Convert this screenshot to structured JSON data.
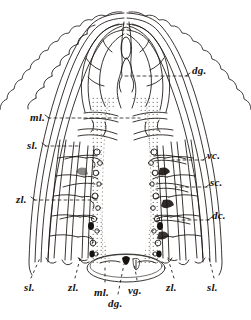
{
  "plate": {
    "kind": "scientific-illustration",
    "subject": "anterior dissection, dorsal view",
    "style": "line engraving, stippled median band",
    "background_color": "#ffffff",
    "ink_color": "#16120f",
    "width": 251,
    "height": 320
  },
  "labels": {
    "right": [
      {
        "id": "dg-right",
        "text": "dg.",
        "x": 192,
        "y": 70,
        "leader": "dashed"
      },
      {
        "id": "vc-right",
        "text": "vc.",
        "x": 207,
        "y": 155,
        "leader": "dashed"
      },
      {
        "id": "sc-right",
        "text": "sc.",
        "x": 210,
        "y": 182,
        "leader": "dashed"
      },
      {
        "id": "dc-right",
        "text": "dc.",
        "x": 212,
        "y": 215,
        "leader": "dashed"
      }
    ],
    "left": [
      {
        "id": "ml-left",
        "text": "ml.",
        "x": 30,
        "y": 112,
        "leader": "dashed"
      },
      {
        "id": "sl-left",
        "text": "sl.",
        "x": 27,
        "y": 141,
        "leader": "dashed"
      },
      {
        "id": "zl-left",
        "text": "zl.",
        "x": 16,
        "y": 195,
        "leader": "dashed"
      }
    ],
    "bottom": [
      {
        "id": "sl-bottom-left",
        "text": "sl.",
        "x": 24,
        "y": 285,
        "leader": "dotted"
      },
      {
        "id": "zl-bottom-left",
        "text": "zl.",
        "x": 68,
        "y": 285,
        "leader": "dotted"
      },
      {
        "id": "ml-bottom",
        "text": "ml.",
        "x": 98,
        "y": 289,
        "leader": "dotted"
      },
      {
        "id": "vg-bottom",
        "text": "vg.",
        "x": 131,
        "y": 287,
        "leader": "dotted"
      },
      {
        "id": "dg-bottom",
        "text": "dg.",
        "x": 110,
        "y": 300,
        "leader": "dotted"
      },
      {
        "id": "zl-bottom-right",
        "text": "zl.",
        "x": 166,
        "y": 285,
        "leader": "dotted"
      },
      {
        "id": "sl-bottom-right",
        "text": "sl.",
        "x": 207,
        "y": 285,
        "leader": "dotted"
      }
    ]
  },
  "legend_keys": [
    {
      "abbr": "dg.",
      "meaning": "dorsal ganglion"
    },
    {
      "abbr": "ml.",
      "meaning": "median lobe"
    },
    {
      "abbr": "sl.",
      "meaning": "superior lobe"
    },
    {
      "abbr": "zl.",
      "meaning": "lateral lobe"
    },
    {
      "abbr": "vc.",
      "meaning": "ventral commissure"
    },
    {
      "abbr": "sc.",
      "meaning": "superior commissure"
    },
    {
      "abbr": "dc.",
      "meaning": "dorsal commissure"
    },
    {
      "abbr": "vg.",
      "meaning": "ventral ganglion"
    }
  ]
}
